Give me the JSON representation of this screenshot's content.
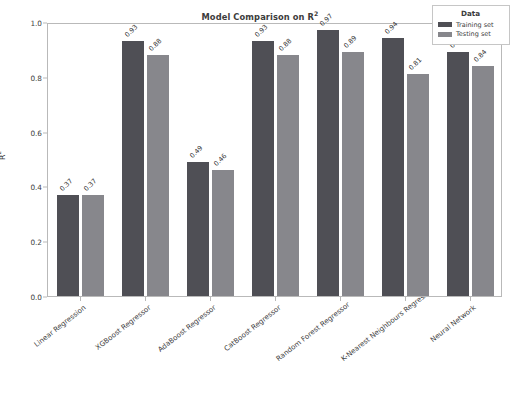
{
  "chart_data": {
    "type": "bar",
    "xlabel": "",
    "ylabel": "R²",
    "ylim": [
      0.0,
      1.0
    ],
    "yticks": [
      "0.0",
      "0.2",
      "0.4",
      "0.6",
      "0.8",
      "1.0"
    ],
    "grid": false,
    "legend": {
      "title": "Data",
      "position": "upper right",
      "entries": [
        {
          "label": "Training set",
          "color": "#4f4f55"
        },
        {
          "label": "Testing set",
          "color": "#87878c"
        }
      ]
    },
    "categories": [
      "Linear Regression",
      "XGBoost Regressor",
      "AdaBoost Regressor",
      "CatBoost Regressor",
      "Random Forest Regressor",
      "K-Nearest Neighbours Regressor",
      "Neural Network"
    ],
    "series": [
      {
        "name": "Training set",
        "color": "#4f4f55",
        "values": [
          0.37,
          0.93,
          0.49,
          0.93,
          0.97,
          0.94,
          0.89
        ],
        "labels": [
          "0.37",
          "0.93",
          "0.49",
          "0.93",
          "0.97",
          "0.94",
          "0.89"
        ]
      },
      {
        "name": "Testing set",
        "color": "#87878c",
        "values": [
          0.37,
          0.88,
          0.46,
          0.88,
          0.89,
          0.81,
          0.84
        ],
        "labels": [
          "0.37",
          "0.88",
          "0.46",
          "0.88",
          "0.89",
          "0.81",
          "0.84"
        ]
      }
    ]
  },
  "axes": {
    "y_label_text": "R",
    "y_label_sup": "2",
    "title_text": "Model Comparison on R",
    "title_sup": "2"
  }
}
